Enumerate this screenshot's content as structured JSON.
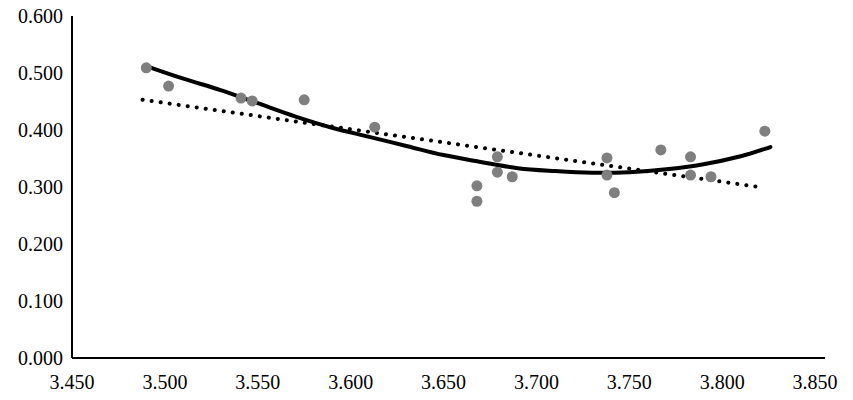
{
  "chart_data": {
    "type": "scatter",
    "title": "",
    "subtitle": "",
    "xlabel": "",
    "ylabel": "",
    "xlim": [
      3.45,
      3.85
    ],
    "ylim": [
      0.0,
      0.6
    ],
    "grid": false,
    "legend": "none",
    "x_ticks": [
      "3.450",
      "3.500",
      "3.550",
      "3.600",
      "3.650",
      "3.700",
      "3.750",
      "3.800",
      "3.850"
    ],
    "x_tick_values": [
      3.45,
      3.5,
      3.55,
      3.6,
      3.65,
      3.7,
      3.75,
      3.8,
      3.85
    ],
    "y_ticks": [
      "0.000",
      "0.100",
      "0.200",
      "0.300",
      "0.400",
      "0.500",
      "0.600"
    ],
    "y_tick_values": [
      0.0,
      0.1,
      0.2,
      0.3,
      0.4,
      0.5,
      0.6
    ],
    "series": [
      {
        "name": "data points",
        "type": "scatter",
        "marker": "filled-circle",
        "color": "#7f7f7f",
        "marker_size": 11,
        "points": [
          {
            "x": 3.49,
            "y": 0.509
          },
          {
            "x": 3.502,
            "y": 0.477
          },
          {
            "x": 3.541,
            "y": 0.456
          },
          {
            "x": 3.547,
            "y": 0.451
          },
          {
            "x": 3.575,
            "y": 0.453
          },
          {
            "x": 3.613,
            "y": 0.405
          },
          {
            "x": 3.668,
            "y": 0.302
          },
          {
            "x": 3.668,
            "y": 0.275
          },
          {
            "x": 3.679,
            "y": 0.353
          },
          {
            "x": 3.679,
            "y": 0.326
          },
          {
            "x": 3.687,
            "y": 0.318
          },
          {
            "x": 3.738,
            "y": 0.351
          },
          {
            "x": 3.738,
            "y": 0.321
          },
          {
            "x": 3.742,
            "y": 0.29
          },
          {
            "x": 3.767,
            "y": 0.365
          },
          {
            "x": 3.783,
            "y": 0.353
          },
          {
            "x": 3.783,
            "y": 0.321
          },
          {
            "x": 3.794,
            "y": 0.318
          },
          {
            "x": 3.823,
            "y": 0.398
          }
        ]
      },
      {
        "name": "quadratic trendline",
        "type": "line",
        "style": "solid",
        "color": "#000000",
        "width": 4,
        "x_start": 3.49,
        "x_end": 3.826,
        "curve_points": [
          {
            "x": 3.49,
            "y": 0.512
          },
          {
            "x": 3.51,
            "y": 0.49
          },
          {
            "x": 3.53,
            "y": 0.47
          },
          {
            "x": 3.55,
            "y": 0.447
          },
          {
            "x": 3.57,
            "y": 0.424
          },
          {
            "x": 3.59,
            "y": 0.404
          },
          {
            "x": 3.61,
            "y": 0.388
          },
          {
            "x": 3.63,
            "y": 0.372
          },
          {
            "x": 3.65,
            "y": 0.356
          },
          {
            "x": 3.67,
            "y": 0.344
          },
          {
            "x": 3.69,
            "y": 0.333
          },
          {
            "x": 3.71,
            "y": 0.328
          },
          {
            "x": 3.73,
            "y": 0.325
          },
          {
            "x": 3.75,
            "y": 0.326
          },
          {
            "x": 3.77,
            "y": 0.331
          },
          {
            "x": 3.79,
            "y": 0.34
          },
          {
            "x": 3.81,
            "y": 0.354
          },
          {
            "x": 3.826,
            "y": 0.37
          }
        ]
      },
      {
        "name": "linear trendline",
        "type": "line",
        "style": "dotted",
        "color": "#000000",
        "width": 4,
        "x_start": 3.488,
        "x_end": 3.82,
        "curve_points": [
          {
            "x": 3.488,
            "y": 0.453
          },
          {
            "x": 3.82,
            "y": 0.3
          }
        ]
      }
    ]
  },
  "axes": {
    "axis_color": "#000000",
    "axis_line_width": 2
  }
}
